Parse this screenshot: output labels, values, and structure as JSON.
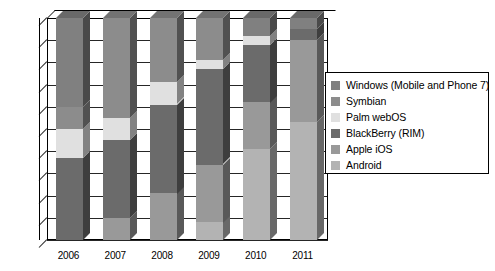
{
  "chart_data": {
    "type": "bar",
    "subtype": "100% stacked column (3D)",
    "title": "",
    "xlabel": "",
    "ylabel": "",
    "ylim": [
      0,
      100
    ],
    "ytick_labels": [
      "0%",
      "10%",
      "20%",
      "30%",
      "40%",
      "50%",
      "60%",
      "70%",
      "80%",
      "90%",
      "100%"
    ],
    "ytick_values": [
      0,
      10,
      20,
      30,
      40,
      50,
      60,
      70,
      80,
      90,
      100
    ],
    "grid": true,
    "legend_position": "right",
    "categories": [
      "2006",
      "2007",
      "2008",
      "2009",
      "2010",
      "2011"
    ],
    "series": [
      {
        "name": "Windows (Mobile and Phone 7)",
        "color": "#808080",
        "values": [
          0,
          0,
          0,
          0,
          8,
          5
        ]
      },
      {
        "name": "Symbian",
        "color": "#8c8c8c",
        "values": [
          40,
          45,
          29,
          19,
          0,
          0
        ]
      },
      {
        "name": "Palm webOS",
        "color": "#e0e0e0",
        "values": [
          13,
          10,
          10,
          4,
          4,
          0
        ]
      },
      {
        "name": "BlackBerry (RIM)",
        "color": "#6b6b6b",
        "values": [
          37,
          35,
          40,
          43,
          26,
          5
        ]
      },
      {
        "name": "Apple iOS",
        "color": "#999999",
        "values": [
          0,
          10,
          21,
          26,
          21,
          37
        ]
      },
      {
        "name": "Android",
        "color": "#b3b3b3",
        "values": [
          0,
          0,
          0,
          8,
          41,
          53
        ]
      }
    ],
    "stack_order_bottom_to_top": [
      "Android",
      "Apple iOS",
      "BlackBerry (RIM)",
      "Palm webOS",
      "Symbian",
      "Windows (Mobile and Phone 7)"
    ],
    "stacks": {
      "2006": [
        {
          "name": "BlackBerry (RIM)",
          "from": 0,
          "to": 37
        },
        {
          "name": "Palm webOS",
          "from": 37,
          "to": 50
        },
        {
          "name": "Symbian",
          "from": 50,
          "to": 60
        },
        {
          "name": "Windows (Mobile and Phone 7)",
          "from": 60,
          "to": 100
        }
      ],
      "2007": [
        {
          "name": "Apple iOS",
          "from": 0,
          "to": 10
        },
        {
          "name": "BlackBerry (RIM)",
          "from": 10,
          "to": 45
        },
        {
          "name": "Palm webOS",
          "from": 45,
          "to": 55
        },
        {
          "name": "Symbian",
          "from": 55,
          "to": 100
        }
      ],
      "2008": [
        {
          "name": "Apple iOS",
          "from": 0,
          "to": 21
        },
        {
          "name": "BlackBerry (RIM)",
          "from": 21,
          "to": 61
        },
        {
          "name": "Palm webOS",
          "from": 61,
          "to": 71
        },
        {
          "name": "Symbian",
          "from": 71,
          "to": 100
        }
      ],
      "2009": [
        {
          "name": "Android",
          "from": 0,
          "to": 8
        },
        {
          "name": "Apple iOS",
          "from": 8,
          "to": 34
        },
        {
          "name": "BlackBerry (RIM)",
          "from": 34,
          "to": 77
        },
        {
          "name": "Palm webOS",
          "from": 77,
          "to": 81
        },
        {
          "name": "Symbian",
          "from": 81,
          "to": 100
        }
      ],
      "2010": [
        {
          "name": "Android",
          "from": 0,
          "to": 41
        },
        {
          "name": "Apple iOS",
          "from": 41,
          "to": 62
        },
        {
          "name": "BlackBerry (RIM)",
          "from": 62,
          "to": 88
        },
        {
          "name": "Palm webOS",
          "from": 88,
          "to": 92
        },
        {
          "name": "Windows (Mobile and Phone 7)",
          "from": 92,
          "to": 100
        }
      ],
      "2011": [
        {
          "name": "Android",
          "from": 0,
          "to": 53
        },
        {
          "name": "Apple iOS",
          "from": 53,
          "to": 90
        },
        {
          "name": "BlackBerry (RIM)",
          "from": 90,
          "to": 95
        },
        {
          "name": "Windows (Mobile and Phone 7)",
          "from": 95,
          "to": 100
        }
      ]
    }
  },
  "legend": {
    "items": [
      {
        "label": "Windows (Mobile and Phone 7)",
        "color": "#808080"
      },
      {
        "label": "Symbian",
        "color": "#8c8c8c"
      },
      {
        "label": "Palm webOS",
        "color": "#e0e0e0"
      },
      {
        "label": "BlackBerry (RIM)",
        "color": "#6b6b6b"
      },
      {
        "label": "Apple iOS",
        "color": "#999999"
      },
      {
        "label": "Android",
        "color": "#b3b3b3"
      }
    ]
  }
}
